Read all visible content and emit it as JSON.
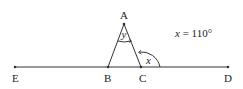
{
  "diagram": {
    "points": {
      "A": {
        "label": "A",
        "x": 124,
        "y": 24
      },
      "B": {
        "label": "B",
        "x": 108,
        "y": 67
      },
      "C": {
        "label": "C",
        "x": 141,
        "y": 67
      },
      "D": {
        "label": "D",
        "x": 228,
        "y": 67
      },
      "E": {
        "label": "E",
        "x": 15,
        "y": 67
      }
    },
    "angles": {
      "apex": {
        "label": "y"
      },
      "exterior": {
        "label": "x"
      }
    },
    "given": {
      "var": "x",
      "eq": " = 110°"
    },
    "stroke_color": "#333333"
  }
}
